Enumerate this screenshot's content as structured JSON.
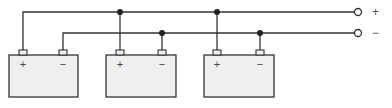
{
  "diagram": {
    "output_terminals": {
      "positive": "+",
      "negative": "−"
    },
    "batteries": [
      {
        "id": 1,
        "positive_label": "+",
        "negative_label": "−"
      },
      {
        "id": 2,
        "positive_label": "+",
        "negative_label": "−"
      },
      {
        "id": 3,
        "positive_label": "+",
        "negative_label": "−"
      }
    ],
    "colors": {
      "line": "#333333",
      "battery_fill": "#efefef",
      "background": "#ffffff"
    }
  }
}
